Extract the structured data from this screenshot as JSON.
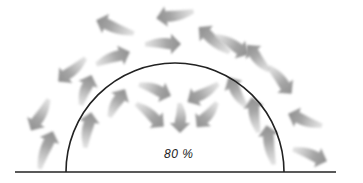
{
  "diagram": {
    "label": "80 %",
    "colors": {
      "arrow": "#9a9a9a",
      "line": "#222222",
      "background": "#ffffff"
    },
    "dome": {
      "cx": 175,
      "cy": 172,
      "r": 109
    },
    "ground": {
      "x1": 15,
      "x2": 336,
      "y": 172
    },
    "arrows": [
      {
        "x": 115,
        "y": 27,
        "rot": 200,
        "len": 40
      },
      {
        "x": 175,
        "y": 15,
        "rot": 170,
        "len": 38
      },
      {
        "x": 214,
        "y": 40,
        "rot": 220,
        "len": 40
      },
      {
        "x": 113,
        "y": 58,
        "rot": -20,
        "len": 36
      },
      {
        "x": 163,
        "y": 44,
        "rot": 0,
        "len": 36
      },
      {
        "x": 232,
        "y": 45,
        "rot": 30,
        "len": 38
      },
      {
        "x": 72,
        "y": 70,
        "rot": 140,
        "len": 36
      },
      {
        "x": 258,
        "y": 58,
        "rot": 230,
        "len": 34
      },
      {
        "x": 86,
        "y": 90,
        "rot": -70,
        "len": 32
      },
      {
        "x": 155,
        "y": 90,
        "rot": 20,
        "len": 34
      },
      {
        "x": 203,
        "y": 93,
        "rot": 150,
        "len": 36
      },
      {
        "x": 237,
        "y": 92,
        "rot": 240,
        "len": 34
      },
      {
        "x": 280,
        "y": 80,
        "rot": 50,
        "len": 36
      },
      {
        "x": 40,
        "y": 115,
        "rot": 120,
        "len": 36
      },
      {
        "x": 117,
        "y": 103,
        "rot": -60,
        "len": 32
      },
      {
        "x": 150,
        "y": 115,
        "rot": 40,
        "len": 36
      },
      {
        "x": 180,
        "y": 118,
        "rot": 90,
        "len": 30
      },
      {
        "x": 207,
        "y": 115,
        "rot": 130,
        "len": 32
      },
      {
        "x": 255,
        "y": 115,
        "rot": -100,
        "len": 36
      },
      {
        "x": 305,
        "y": 120,
        "rot": 200,
        "len": 36
      },
      {
        "x": 46,
        "y": 150,
        "rot": -70,
        "len": 40
      },
      {
        "x": 88,
        "y": 130,
        "rot": -80,
        "len": 36
      },
      {
        "x": 270,
        "y": 145,
        "rot": -100,
        "len": 40
      },
      {
        "x": 310,
        "y": 155,
        "rot": 20,
        "len": 36
      },
      {
        "x": 170,
        "y": 78,
        "rot": 0,
        "len": 0
      }
    ]
  }
}
